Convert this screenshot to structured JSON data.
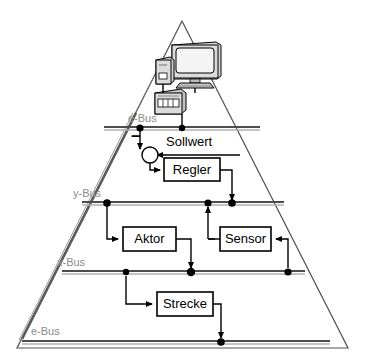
{
  "diagram": {
    "shape": "triangle",
    "colors": {
      "bus_label": "#8b8b8b",
      "bus_line_dark": "#4d4d4d",
      "bus_line_light": "#b5b5b5",
      "outline": "#404040",
      "box_fill": "#ffffff",
      "box_stroke": "#000000",
      "device_fill": "#d9d9d9",
      "device_shade": "#9a9a9a"
    },
    "buses": [
      {
        "name": "bus-e-top",
        "label": "e-Bus",
        "label_x": 128,
        "label_y": 113,
        "y": 128,
        "x1": 104,
        "x2": 260
      },
      {
        "name": "bus-y",
        "label": "y-Bus",
        "label_x": 73,
        "label_y": 188,
        "y": 203,
        "x1": 82,
        "x2": 284
      },
      {
        "name": "bus-x",
        "label": "x-Bus",
        "label_x": 57,
        "label_y": 257,
        "y": 272,
        "x1": 62,
        "x2": 305
      },
      {
        "name": "bus-e-bottom",
        "label": "e-Bus",
        "label_x": 31,
        "label_y": 326,
        "y": 342,
        "x1": 22,
        "x2": 330
      }
    ],
    "blocks": [
      {
        "name": "regler",
        "label": "Regler",
        "x": 164,
        "y": 158,
        "w": 56,
        "h": 23
      },
      {
        "name": "aktor",
        "label": "Aktor",
        "x": 123,
        "y": 227,
        "w": 53,
        "h": 24
      },
      {
        "name": "sensor",
        "label": "Sensor",
        "x": 220,
        "y": 227,
        "w": 51,
        "h": 24
      },
      {
        "name": "strecke",
        "label": "Strecke",
        "x": 157,
        "y": 292,
        "w": 56,
        "h": 24
      }
    ],
    "annotations": [
      {
        "name": "sollwert",
        "label": "Sollwert",
        "x": 166,
        "y": 134
      },
      {
        "name": "minus-sign",
        "label": "−",
        "x": 131,
        "y": 136
      }
    ],
    "devices": [
      {
        "name": "crt-monitor"
      },
      {
        "name": "desktop-tower"
      },
      {
        "name": "network-switch"
      }
    ],
    "junction_nodes": [
      {
        "bus": "bus-e-top",
        "x": 140
      },
      {
        "bus": "bus-e-top",
        "x": 182
      },
      {
        "bus": "bus-y",
        "x": 107
      },
      {
        "bus": "bus-y",
        "x": 208
      },
      {
        "bus": "bus-y",
        "x": 232
      },
      {
        "bus": "bus-x",
        "x": 126
      },
      {
        "bus": "bus-x",
        "x": 191
      },
      {
        "bus": "bus-x",
        "x": 288
      },
      {
        "bus": "bus-e-bottom",
        "x": 221
      }
    ]
  }
}
